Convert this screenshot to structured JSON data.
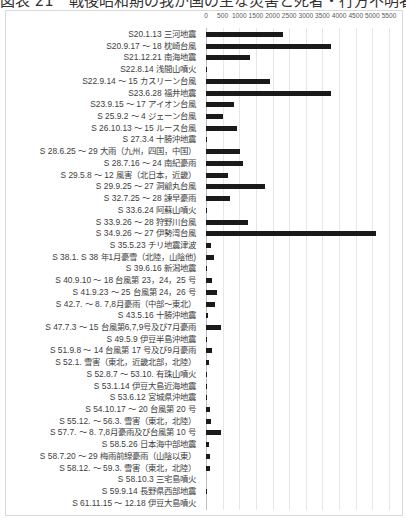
{
  "title": "図表 21　戦後昭和期の我が国の主な災害と死者・行方不明者数",
  "chart_data": {
    "type": "bar",
    "orientation": "horizontal",
    "title": "戦後昭和期の我が国の主な災害と死者・行方不明者数",
    "xlabel": "",
    "ylabel": "",
    "xlim": [
      0,
      5500
    ],
    "x_ticks": [
      "0",
      "500",
      "1000",
      "1500",
      "2000",
      "2500",
      "3000",
      "3500",
      "4000",
      "4500",
      "5000",
      "5500"
    ],
    "x_tick_values": [
      0,
      500,
      1000,
      1500,
      2000,
      2500,
      3000,
      3500,
      4000,
      4500,
      5000,
      5500
    ],
    "axis_position": "top",
    "grid": true,
    "legend": false,
    "bar_color": "#1a1a1a",
    "categories": [
      "S20.1.13 三河地震",
      "S20.9.17 ～ 18 枕崎台風",
      "S21.12.21 南海地震",
      "S22.8.14 浅間山噴火",
      "S22.9.14 ～ 15 カスリーン台風",
      "S23.6.28 福井地震",
      "S23.9.15 ～ 17 アイオン台風",
      "S 25.9.2 ～ 4 ジェーン台風",
      "S 26.10.13 ～ 15 ルース台風",
      "S 27.3.4 十勝沖地震",
      "S 28.6.25 ～ 29 大雨（九州，四国，中国）",
      "S 28.7.16 ～ 24 南紀豪雨",
      "S 29.5.8 ～ 12 風害（北日本，近畿）",
      "S 29.9.25 ～ 27 洞爺丸台風",
      "S 32.7.25 ～ 28 諫早豪雨",
      "S 33.6.24 阿蘇山噴火",
      "S 33.9.26 ～ 28 狩野川台風",
      "S 34.9.26 ～ 27 伊勢湾台風",
      "S 35.5.23 チリ地震津波",
      "S 38.1. S 38 年1月豪雪（北陸，山陰他)",
      "S 39.6.16 新潟地震",
      "S 40.9.10 ～ 18 台風第 23，24，25 号",
      "S 41.9.23 ～ 25 台風第 24，26 号",
      "S 42.7. ～ 8. 7,8月豪雨（中部～東北）",
      "S 43.5.16 十勝沖地震",
      "S 47.7.3 ～ 15 台風第6,7,9号及び7月豪雨",
      "S 49.5.9 伊豆半島沖地震",
      "S 51.9.8 ～ 14 台風第 17 号及び9月豪雨",
      "S 52.1. 雪害（東北，近畿北部，北陸）",
      "S 52.8.7 ～ 53.10. 有珠山噴火",
      "S 53.1.14 伊豆大島近海地震",
      "S 53.6.12 宮城県沖地震",
      "S 54.10.17 ～ 20 台風第 20 号",
      "S 55.12. ～ 56.3. 雪害（東北，北陸）",
      "S 57.7. ～ 8. 7,8月豪雨及び台風第 10 号",
      "S 58.5.26 日本海中部地震",
      "S 58.7.20 ～ 29 梅雨前線豪雨（山陰以東）",
      "S 58.12. ～ 59.3. 雪害（東北，北陸）",
      "S 58.10.3 三宅島噴火",
      "S 59.9.14 長野県西部地震",
      "S 61.11.15 ～ 12.18 伊豆大島噴火"
    ],
    "values": [
      2306,
      3756,
      1330,
      11,
      1930,
      3769,
      838,
      508,
      943,
      33,
      1013,
      1124,
      670,
      1761,
      722,
      12,
      1269,
      5098,
      142,
      231,
      26,
      181,
      317,
      256,
      52,
      447,
      30,
      169,
      101,
      3,
      25,
      28,
      115,
      152,
      439,
      104,
      117,
      131,
      0,
      29,
      0
    ]
  }
}
